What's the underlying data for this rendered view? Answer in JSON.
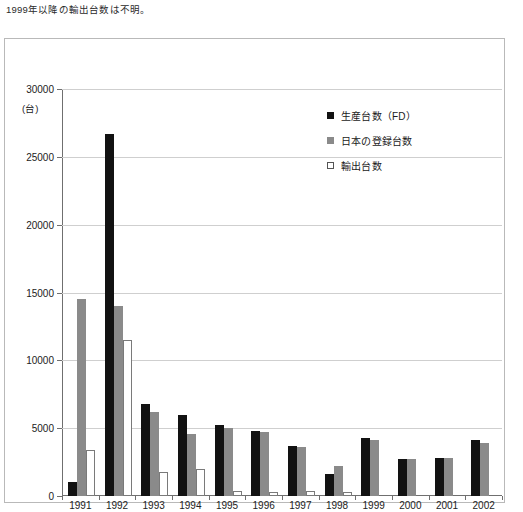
{
  "caption": "1999年以降の輸出台数は不明。",
  "chart_data": {
    "type": "bar",
    "title": "",
    "xlabel": "(年)",
    "ylabel": "(台)",
    "ylim": [
      0,
      30000
    ],
    "ytick_labels": [
      "30000",
      "25000",
      "20000",
      "15000",
      "10000",
      "5000",
      "0"
    ],
    "ytick_values": [
      30000,
      25000,
      20000,
      15000,
      10000,
      5000,
      0
    ],
    "grid": true,
    "legend_position": "inside-top-right",
    "categories": [
      "1991",
      "1992",
      "1993",
      "1994",
      "1995",
      "1996",
      "1997",
      "1998",
      "1999",
      "2000",
      "2001",
      "2002"
    ],
    "series": [
      {
        "name": "生産台数（FD）",
        "color": "#121212",
        "values": [
          1000,
          26700,
          6800,
          6000,
          5250,
          4800,
          3650,
          1600,
          4300,
          2750,
          2800,
          4100
        ]
      },
      {
        "name": "日本の登録台数",
        "color": "#8a8a8a",
        "values": [
          14500,
          14000,
          6200,
          4600,
          5050,
          4700,
          3600,
          2200,
          4100,
          2750,
          2800,
          3900
        ]
      },
      {
        "name": "輸出台数",
        "color": "#ffffff",
        "values": [
          3400,
          11500,
          1800,
          2000,
          400,
          300,
          350,
          300,
          null,
          null,
          null,
          null
        ]
      }
    ],
    "annotations": [
      "1999年以降の輸出台数は不明。"
    ]
  }
}
